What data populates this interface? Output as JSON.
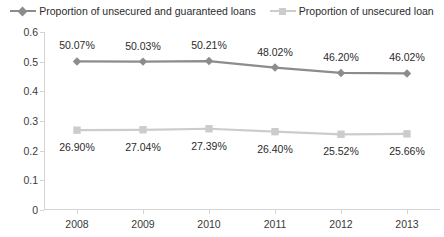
{
  "legend": {
    "position": "top",
    "entries": [
      {
        "label": "Proportion of unsecured and guaranteed loans",
        "marker": "diamond-marker-icon",
        "color": "#8c8c8c"
      },
      {
        "label": "Proportion of unsecured loan",
        "marker": "square-marker-icon",
        "color": "#cccccc"
      }
    ]
  },
  "chart_data": {
    "type": "line",
    "title": "",
    "xlabel": "",
    "ylabel": "",
    "categories": [
      "2008",
      "2009",
      "2010",
      "2011",
      "2012",
      "2013"
    ],
    "ylim": [
      0,
      0.6
    ],
    "yticks": [
      "0",
      "0.1",
      "0.2",
      "0.3",
      "0.4",
      "0.5",
      "0.6"
    ],
    "ytick_values": [
      0,
      0.1,
      0.2,
      0.3,
      0.4,
      0.5,
      0.6
    ],
    "grid": false,
    "series": [
      {
        "name": "Proportion of unsecured and guaranteed loans",
        "color": "#8c8c8c",
        "marker": "diamond",
        "values": [
          0.5007,
          0.5003,
          0.5021,
          0.4802,
          0.462,
          0.4602
        ],
        "labels": [
          "50.07%",
          "50.03%",
          "50.21%",
          "48.02%",
          "46.20%",
          "46.02%"
        ],
        "label_position": "above"
      },
      {
        "name": "Proportion of unsecured loan",
        "color": "#cccccc",
        "marker": "square",
        "values": [
          0.269,
          0.2704,
          0.2739,
          0.264,
          0.2552,
          0.2566
        ],
        "labels": [
          "26.90%",
          "27.04%",
          "27.39%",
          "26.40%",
          "25.52%",
          "25.66%"
        ],
        "label_position": "below"
      }
    ]
  }
}
